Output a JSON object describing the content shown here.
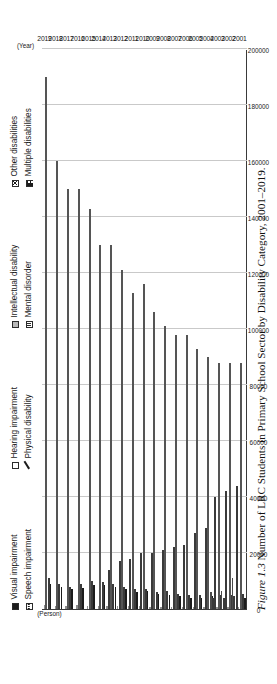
{
  "caption": {
    "figure_number": "Figure 1.3",
    "text": "Number of LRC Students in Primary School Sector by Disability Category, 2001–2019."
  },
  "legend": {
    "items": [
      {
        "label": "Visual impairment",
        "marker": "solid-square-icon",
        "key": "visual"
      },
      {
        "label": "Hearing impairment",
        "marker": "empty-square-icon",
        "key": "hearing"
      },
      {
        "label": "Intellectual disability",
        "marker": "grey-square-icon",
        "key": "intellectual"
      },
      {
        "label": "Other disabilities",
        "marker": "crosshatch-square-icon",
        "key": "other"
      },
      {
        "label": "Speech impairment",
        "marker": "dash-line-icon",
        "key": "speech"
      },
      {
        "label": "Physical disability",
        "marker": "slash-icon",
        "key": "physical"
      },
      {
        "label": "Mental disorder",
        "marker": "dotted-square-icon",
        "key": "mental"
      },
      {
        "label": "Multiple disabilities",
        "marker": "multi-square-icon",
        "key": "multiple"
      }
    ]
  },
  "axes": {
    "y_unit": "(Person)",
    "x_unit": "(Year)",
    "y_ticks": [
      "0",
      "20000",
      "40000",
      "60000",
      "80000",
      "100000",
      "120000",
      "140000",
      "160000",
      "180000",
      "200000"
    ],
    "x_ticks": [
      "2001",
      "2002",
      "2003",
      "2004",
      "2005",
      "2006",
      "2007",
      "2008",
      "2009",
      "2010",
      "2011",
      "2012",
      "2013",
      "2014",
      "2015",
      "2016",
      "2017",
      "2018",
      "2019"
    ]
  },
  "chart_data": {
    "type": "bar",
    "orientation": "horizontal",
    "xlabel": "(Year)",
    "ylabel": "(Person)",
    "ylim": [
      0,
      200000
    ],
    "grid": true,
    "legend_position": "top",
    "categories": [
      "2001",
      "2002",
      "2003",
      "2004",
      "2005",
      "2006",
      "2007",
      "2008",
      "2009",
      "2010",
      "2011",
      "2012",
      "2013",
      "2014",
      "2015",
      "2016",
      "2017",
      "2018",
      "2019"
    ],
    "series": [
      {
        "name": "Visual impairment",
        "values": [
          9000,
          8000,
          7000,
          7500,
          8500,
          8500,
          8000,
          7000,
          6000,
          6500,
          5500,
          5000,
          4500,
          4000,
          4000,
          4500,
          4000,
          4000,
          4000
        ]
      },
      {
        "name": "Hearing impairment",
        "values": [
          11000,
          9000,
          8000,
          9000,
          10000,
          9500,
          9000,
          8000,
          7000,
          7000,
          6000,
          6500,
          5500,
          5000,
          5000,
          5500,
          5000,
          5000,
          5500
        ]
      },
      {
        "name": "Intellectual disability",
        "values": [
          190000,
          160000,
          150000,
          150000,
          143000,
          130000,
          130000,
          121000,
          113000,
          116000,
          106000,
          101000,
          98000,
          98000,
          93000,
          90000,
          88000,
          88000,
          88000
        ]
      },
      {
        "name": "Other disabilities",
        "values": [
          0,
          0,
          0,
          0,
          0,
          0,
          14000,
          17000,
          18000,
          20000,
          20000,
          21000,
          22000,
          23000,
          27000,
          29000,
          0,
          0,
          0
        ]
      },
      {
        "name": "Speech impairment",
        "values": [
          1500,
          1200,
          1200,
          1300,
          1200,
          1200,
          1100,
          1000,
          900,
          900,
          800,
          800,
          700,
          700,
          700,
          700,
          700,
          700,
          700
        ]
      },
      {
        "name": "Physical disability",
        "values": [
          0,
          0,
          0,
          0,
          0,
          0,
          0,
          0,
          0,
          0,
          0,
          0,
          0,
          0,
          0,
          0,
          40000,
          42000,
          44000
        ]
      },
      {
        "name": "Mental disorder",
        "values": [
          0,
          0,
          0,
          0,
          0,
          0,
          0,
          0,
          0,
          0,
          0,
          0,
          0,
          0,
          0,
          0,
          4000,
          4000,
          4500
        ]
      },
      {
        "name": "Multiple disabilities",
        "values": [
          0,
          0,
          0,
          0,
          0,
          0,
          0,
          0,
          0,
          0,
          0,
          0,
          0,
          0,
          0,
          0,
          6000,
          6500,
          11000
        ]
      }
    ]
  }
}
